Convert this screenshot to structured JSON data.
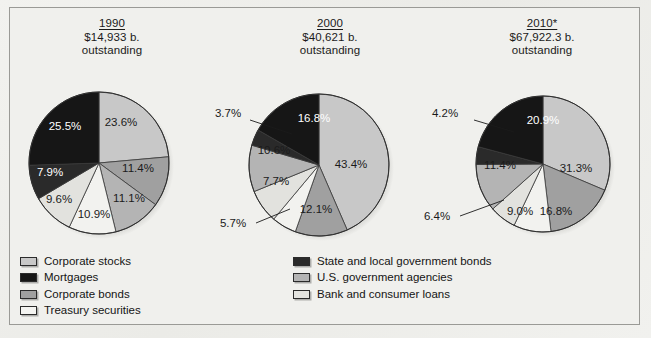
{
  "chart_data": [
    {
      "type": "pie",
      "title": "1990",
      "subtitle": "$14,933 b. outstanding",
      "total_label": "$14,933 b.",
      "outstanding_label": "outstanding",
      "categories": [
        "Corporate stocks",
        "Corporate bonds",
        "U.S. government agencies",
        "Treasury securities",
        "Bank and consumer loans",
        "State and local government bonds",
        "Mortgages"
      ],
      "values": [
        23.6,
        11.4,
        11.1,
        10.9,
        9.6,
        7.9,
        25.5
      ],
      "labels": [
        "23.6%",
        "11.4%",
        "11.1%",
        "10.9%",
        "9.6%",
        "7.9%",
        "25.5%"
      ],
      "unit": "%"
    },
    {
      "type": "pie",
      "title": "2000",
      "subtitle": "$40,621 b. outstanding",
      "total_label": "$40,621 b.",
      "outstanding_label": "outstanding",
      "categories": [
        "Corporate stocks",
        "Corporate bonds",
        "Treasury securities",
        "Bank and consumer loans",
        "U.S. government agencies",
        "State and local government bonds",
        "Mortgages"
      ],
      "values": [
        43.4,
        12.1,
        5.7,
        7.7,
        10.6,
        3.7,
        16.8
      ],
      "labels": [
        "43.4%",
        "12.1%",
        "5.7%",
        "7.7%",
        "10.6%",
        "3.7%",
        "16.8%"
      ],
      "unit": "%"
    },
    {
      "type": "pie",
      "title": "2010*",
      "subtitle": "$67,922.3 b. outstanding",
      "total_label": "$67,922.3 b.",
      "outstanding_label": "outstanding",
      "categories": [
        "Corporate stocks",
        "Corporate bonds",
        "Treasury securities",
        "Bank and consumer loans",
        "U.S. government agencies",
        "State and local government bonds",
        "Mortgages"
      ],
      "values": [
        31.3,
        16.8,
        9.0,
        6.4,
        11.4,
        4.2,
        20.9
      ],
      "labels": [
        "31.3%",
        "16.8%",
        "9.0%",
        "6.4%",
        "11.4%",
        "4.2%",
        "20.9%"
      ],
      "unit": "%"
    }
  ],
  "panels": [
    {
      "year": "1990",
      "amount": "$14,933 b.",
      "outstanding": "outstanding"
    },
    {
      "year": "2000",
      "amount": "$40,621 b.",
      "outstanding": "outstanding"
    },
    {
      "year": "2010*",
      "amount": "$67,922.3 b.",
      "outstanding": "outstanding"
    }
  ],
  "pie_1990": {
    "s0": "23.6%",
    "s1": "11.4%",
    "s2": "11.1%",
    "s3": "10.9%",
    "s4": "9.6%",
    "s5": "7.9%",
    "s6": "25.5%"
  },
  "pie_2000": {
    "s0": "43.4%",
    "s1": "12.1%",
    "s2": "5.7%",
    "s3": "7.7%",
    "s4": "10.6%",
    "s5": "3.7%",
    "s6": "16.8%"
  },
  "pie_2010": {
    "s0": "31.3%",
    "s1": "16.8%",
    "s2": "9.0%",
    "s3": "6.4%",
    "s4": "11.4%",
    "s5": "4.2%",
    "s6": "20.9%"
  },
  "legend": {
    "left": [
      {
        "label": "Corporate stocks",
        "color": "#c8c8c8"
      },
      {
        "label": "Mortgages",
        "color": "#161616"
      },
      {
        "label": "Corporate bonds",
        "color": "#a0a0a0"
      },
      {
        "label": "Treasury securities",
        "color": "#f2f2ef"
      }
    ],
    "right": [
      {
        "label": "State and local government bonds",
        "color": "#2a2a2a"
      },
      {
        "label": "U.S. government agencies",
        "color": "#b4b4b4"
      },
      {
        "label": "Bank and consumer loans",
        "color": "#e2e2de"
      }
    ]
  },
  "colors": {
    "corporate_stocks": "#c8c8c8",
    "mortgages": "#161616",
    "corporate_bonds": "#a0a0a0",
    "treasury_securities": "#f2f2ef",
    "state_local_bonds": "#2a2a2a",
    "us_govt_agencies": "#b4b4b4",
    "bank_consumer_loans": "#e2e2de",
    "background": "#f0f0ed",
    "frame_border": "#9a9a96",
    "text": "#141414"
  }
}
